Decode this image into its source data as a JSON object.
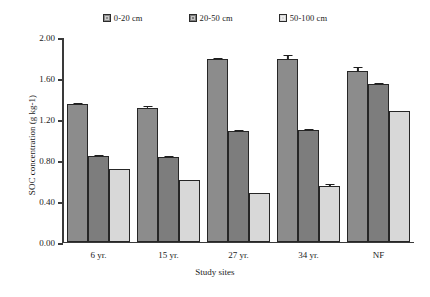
{
  "chart_data": {
    "type": "bar",
    "title": "",
    "categories": [
      "6 yr.",
      "15 yr.",
      "27 yr.",
      "34 yr.",
      "NF"
    ],
    "series": [
      {
        "name": "0-20 cm",
        "color": "#8c8c8c",
        "values": [
          1.34,
          1.3,
          1.78,
          1.78,
          1.66
        ],
        "errors": [
          0.02,
          0.03,
          0.02,
          0.05,
          0.05
        ]
      },
      {
        "name": "20-50 cm",
        "color": "#7d7d7d",
        "values": [
          0.83,
          0.82,
          1.08,
          1.09,
          1.54
        ],
        "errors": [
          0.02,
          0.02,
          0.02,
          0.02,
          0.02
        ]
      },
      {
        "name": "50-100 cm",
        "color": "#d8d8d8",
        "values": [
          0.71,
          0.6,
          0.47,
          0.54,
          1.27
        ],
        "errors": [
          0.01,
          0.01,
          0.01,
          0.03,
          0.01
        ]
      }
    ],
    "xlabel": "Study sites",
    "ylabel": "SOC concentration (g kg-1)",
    "ylim": [
      0.0,
      2.0
    ],
    "ytick_labels": [
      "0.00",
      "0.40",
      "0.80",
      "1.20",
      "1.60",
      "2.00"
    ],
    "ytick_values": [
      0.0,
      0.4,
      0.8,
      1.2,
      1.6,
      2.0
    ],
    "grid": false,
    "legend_position": "top",
    "error_bars": true
  },
  "caption": {
    "text": "partial-caption-line"
  }
}
